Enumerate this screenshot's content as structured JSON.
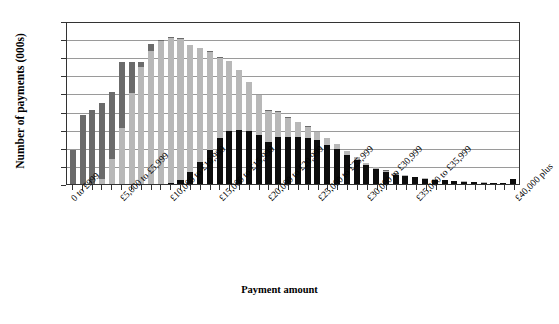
{
  "chart_data": {
    "type": "bar",
    "title": "",
    "subtitle": "",
    "xlabel": "Payment amount",
    "ylabel": "Number of payments (000s)",
    "ylim": [
      0,
      45
    ],
    "yticks": [
      0,
      5,
      10,
      15,
      20,
      25,
      30,
      35,
      40,
      45
    ],
    "grid": true,
    "legend_position": "none",
    "stacked": true,
    "bar_count": 46,
    "categories": [
      "0 to £999",
      "£1,000 to £1,999",
      "£2,000 to £2,999",
      "£3,000 to £3,999",
      "£4,000 to £4,999",
      "£5,000 to £5,999",
      "£6,000 to £6,999",
      "£7,000 to £7,999",
      "£8,000 to £8,999",
      "£9,000 to £9,999",
      "£10,000 to £10,999",
      "£11,000 to £11,999",
      "£12,000 to £12,999",
      "£13,000 to £13,999",
      "£14,000 to £14,999",
      "£15,000 to £15,999",
      "£16,000 to £16,999",
      "£17,000 to £17,999",
      "£18,000 to £18,999",
      "£19,000 to £19,999",
      "£20,000 to £20,999",
      "£21,000 to £21,999",
      "£22,000 to £22,999",
      "£23,000 to £23,999",
      "£24,000 to £24,999",
      "£25,000 to £25,999",
      "£26,000 to £26,999",
      "£27,000 to £27,999",
      "£28,000 to £28,999",
      "£29,000 to £29,999",
      "£30,000 to £30,999",
      "£31,000 to £31,999",
      "£32,000 to £32,999",
      "£33,000 to £33,999",
      "£34,000 to £34,999",
      "£35,000 to £35,999",
      "£36,000 to £36,999",
      "£37,000 to £37,999",
      "£38,000 to £38,999",
      "£39,000 to £39,999",
      "£40,000 to £40,999",
      "£41,000 to £41,999",
      "£42,000 to £42,999",
      "£43,000 to £43,999",
      "£44,000 to £44,999",
      "£40,000 plus"
    ],
    "visible_tick_labels": [
      {
        "index": 0,
        "text": "0 to £999"
      },
      {
        "index": 5,
        "text": "£5,000 to £5,999"
      },
      {
        "index": 10,
        "text": "£10,000 to £10,999"
      },
      {
        "index": 15,
        "text": "£15,000 to £15,999"
      },
      {
        "index": 20,
        "text": "£20,000 to £20,999"
      },
      {
        "index": 25,
        "text": "£25,000 to £25,999"
      },
      {
        "index": 30,
        "text": "£30,000 to £30,999"
      },
      {
        "index": 35,
        "text": "£35,000 to £35,999"
      },
      {
        "index": 45,
        "text": "£40,000 plus"
      }
    ],
    "series": [
      {
        "name": "bottom-segment",
        "color": "#0d0d0d",
        "values": [
          0,
          0,
          0,
          0,
          0,
          0,
          0,
          0,
          0,
          0,
          0.2,
          1.0,
          3.3,
          6.1,
          9.5,
          12.6,
          14.5,
          15.0,
          14.6,
          13.4,
          11.6,
          13.0,
          12.9,
          12.9,
          12.8,
          12.1,
          10.9,
          9.7,
          8.1,
          6.6,
          5.2,
          4.1,
          3.3,
          2.6,
          2.2,
          1.8,
          1.4,
          1.2,
          1.0,
          0.8,
          0.6,
          0.5,
          0.4,
          0.3,
          0.25,
          1.5
        ]
      },
      {
        "name": "middle-segment",
        "color": "#b8b8b8",
        "values": [
          0,
          0,
          0,
          1.5,
          6.8,
          15.5,
          25.2,
          32.2,
          36.7,
          39.6,
          40.0,
          39.0,
          35.0,
          31.4,
          27.0,
          22.3,
          19.4,
          16.4,
          13.5,
          11.2,
          8.6,
          7.0,
          5.4,
          4.2,
          3.0,
          2.2,
          1.7,
          1.3,
          1.0,
          0.8,
          0.6,
          0.5,
          0.4,
          0.3,
          0.25,
          0.2,
          0.2,
          0.15,
          0.1,
          0.1,
          0.1,
          0.1,
          0.05,
          0.05,
          0.05,
          0
        ]
      },
      {
        "name": "top-segment",
        "color": "#6b6b6b",
        "values": [
          9.3,
          19.0,
          20.3,
          21.0,
          18.6,
          18.1,
          8.5,
          1.5,
          1.9,
          0.2,
          0.3,
          0.2,
          0.1,
          0.1,
          0.1,
          0.1,
          0.1,
          0.1,
          0.1,
          0.1,
          0.1,
          0.1,
          0.1,
          0.1,
          0.1,
          0.1,
          0.1,
          0.05,
          0.05,
          0.05,
          0.05,
          0.05,
          0.05,
          0.05,
          0.05,
          0.05,
          0.05,
          0.05,
          0.05,
          0.05,
          0.05,
          0.05,
          0.05,
          0.05,
          0.05,
          0
        ]
      }
    ],
    "totals": [
      9.3,
      19.0,
      20.3,
      22.5,
      25.4,
      33.6,
      33.7,
      33.7,
      38.6,
      39.8,
      40.5,
      40.2,
      38.4,
      37.6,
      36.6,
      35.0,
      34.0,
      31.5,
      28.2,
      24.7,
      20.3,
      20.1,
      18.4,
      17.2,
      15.9,
      14.4,
      12.7,
      11.05,
      9.15,
      7.45,
      5.85,
      4.65,
      3.75,
      2.95,
      2.5,
      2.05,
      1.65,
      1.4,
      1.15,
      0.95,
      0.75,
      0.65,
      0.5,
      0.4,
      0.35,
      1.5
    ]
  }
}
